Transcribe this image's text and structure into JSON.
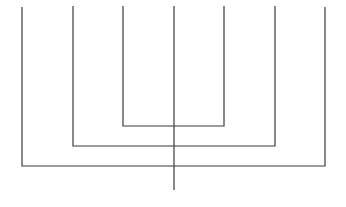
{
  "diagram": {
    "type": "nested-u-lines",
    "stroke_color": "#3a3a3a",
    "background": "#ffffff",
    "stroke_width": 1.2,
    "center_stem": {
      "x": 174,
      "y1": 6,
      "y2": 190
    },
    "u_shapes": [
      {
        "name": "inner",
        "x_left": 123,
        "x_right": 224,
        "y_top": 6,
        "y_bottom": 126
      },
      {
        "name": "middle",
        "x_left": 73,
        "x_right": 275,
        "y_top": 6,
        "y_bottom": 146
      },
      {
        "name": "outer",
        "x_left": 22,
        "x_right": 325,
        "y_top": 7,
        "y_bottom": 166
      }
    ]
  }
}
